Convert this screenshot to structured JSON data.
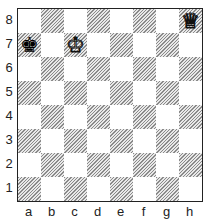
{
  "board": {
    "files": [
      "a",
      "b",
      "c",
      "d",
      "e",
      "f",
      "g",
      "h"
    ],
    "ranks": [
      "8",
      "7",
      "6",
      "5",
      "4",
      "3",
      "2",
      "1"
    ],
    "pieces": [
      {
        "square": "h8",
        "type": "queen",
        "color": "white",
        "glyph": "♕"
      },
      {
        "square": "a7",
        "type": "king",
        "color": "black",
        "glyph": "♚"
      },
      {
        "square": "c7",
        "type": "king",
        "color": "white",
        "glyph": "♔"
      }
    ],
    "light_color": "#ffffff",
    "dark_style": "hatched-gray"
  }
}
